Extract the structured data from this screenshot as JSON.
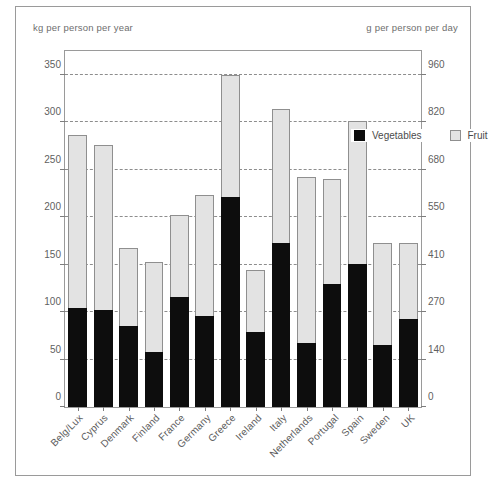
{
  "title_fragment": "",
  "axis": {
    "left_caption": "kg per person per year",
    "right_caption": "g per person per day",
    "left_ticks": [
      "0",
      "50",
      "100",
      "150",
      "200",
      "250",
      "300",
      "350"
    ],
    "right_ticks": [
      "0",
      "140",
      "270",
      "410",
      "550",
      "680",
      "820",
      "960"
    ]
  },
  "legend": {
    "vegetables_label": "Vegetables",
    "fruit_label": "Fruit"
  },
  "colors": {
    "vegetables": "#0d0d0d",
    "fruit": "#e3e3e3",
    "frame": "#9a9a9a",
    "grid": "#8d8d8d",
    "text": "#5d5d5d"
  },
  "chart_data": {
    "type": "bar",
    "title": "",
    "subtitle": "",
    "xlabel": "",
    "ylabel": "kg per person per year",
    "ylabel_right": "g per person per day",
    "ylim": [
      0,
      375
    ],
    "ylim_right": [
      0,
      1028
    ],
    "yticks": [
      0,
      50,
      100,
      150,
      200,
      250,
      300,
      350
    ],
    "yticks_right": [
      0,
      140,
      270,
      410,
      550,
      680,
      820,
      960
    ],
    "grid": true,
    "stacked": true,
    "legend_position": "top-right inside plot",
    "categories": [
      "Belg/Lux",
      "Cyprus",
      "Denmark",
      "Finland",
      "France",
      "Germany",
      "Greece",
      "Ireland",
      "Italy",
      "Netherlands",
      "Portugal",
      "Spain",
      "Sweden",
      "UK"
    ],
    "series": [
      {
        "name": "Vegetables",
        "color": "#0d0d0d",
        "values": [
          104,
          102,
          85,
          58,
          116,
          96,
          221,
          79,
          173,
          67,
          130,
          151,
          65,
          93
        ]
      },
      {
        "name": "Fruit",
        "color": "#e3e3e3",
        "values": [
          183,
          174,
          83,
          95,
          86,
          127,
          129,
          65,
          141,
          175,
          110,
          150,
          108,
          80
        ]
      }
    ],
    "totals": [
      287,
      276,
      168,
      153,
      202,
      223,
      350,
      144,
      314,
      242,
      240,
      301,
      173,
      173
    ]
  }
}
